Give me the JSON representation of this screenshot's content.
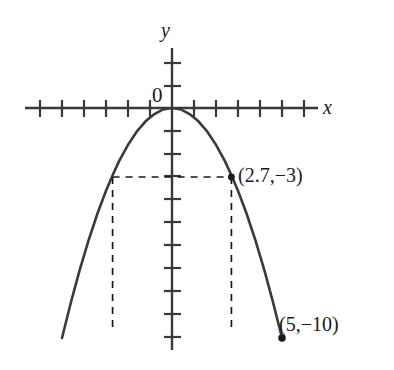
{
  "figure": {
    "kind": "cartesian-graph",
    "background_color": "#ffffff",
    "stroke_color": "#3a3a3a",
    "text_color": "#1a1a1a"
  },
  "labels": {
    "y_axis": "y",
    "x_axis": "x",
    "origin": "0",
    "point_a": "(2.7,−3)",
    "point_b": "(5,−10)"
  },
  "chart_data": {
    "type": "line",
    "title": "",
    "xlabel": "x",
    "ylabel": "y",
    "grid": false,
    "legend": null,
    "curve_name": "downward parabola through origin",
    "equation": "y = -0.4 x^2",
    "vertex": [
      0,
      0
    ],
    "xlim": [
      -6.1,
      6.1
    ],
    "ylim": [
      -10.4,
      2.0
    ],
    "x_ticks": [
      -6,
      -5,
      -4,
      -3,
      -2,
      -1,
      1,
      2,
      3,
      4,
      5,
      6
    ],
    "y_ticks": [
      2,
      1,
      -1,
      -2,
      -3,
      -4,
      -5,
      -6,
      -7,
      -8,
      -9,
      -10
    ],
    "x": [
      -5.0,
      -4.6,
      -4.2,
      -3.8,
      -3.4,
      -3.0,
      -2.7,
      -2.4,
      -2.0,
      -1.6,
      -1.2,
      -0.8,
      -0.4,
      0.0,
      0.4,
      0.8,
      1.2,
      1.6,
      2.0,
      2.4,
      2.7,
      3.0,
      3.4,
      3.8,
      4.2,
      4.6,
      5.0
    ],
    "y": [
      -10.0,
      -8.47,
      -7.06,
      -5.78,
      -4.62,
      -3.6,
      -2.92,
      -2.3,
      -1.6,
      -1.02,
      -0.58,
      -0.26,
      -0.06,
      0.0,
      -0.06,
      -0.26,
      -0.58,
      -1.02,
      -1.6,
      -2.3,
      -2.92,
      -3.6,
      -4.62,
      -5.78,
      -7.06,
      -8.47,
      -10.0
    ],
    "annotated_points": [
      {
        "name": "point_a",
        "coords": [
          2.7,
          -3
        ],
        "label": "(2.7,−3)",
        "marker": "dot",
        "guides": "dashed"
      },
      {
        "name": "point_b",
        "coords": [
          5,
          -10
        ],
        "label": "(5,−10)",
        "marker": "dot",
        "guides": "none"
      }
    ],
    "mirror_guide_point": [
      -2.7,
      -3
    ]
  }
}
